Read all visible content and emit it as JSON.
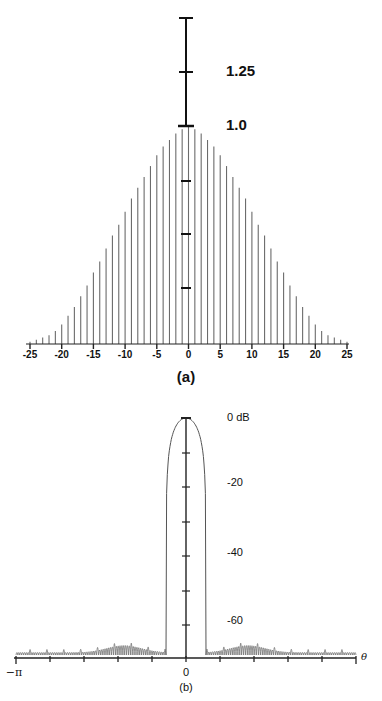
{
  "chart_data": [
    {
      "type": "bar",
      "title": "(a)",
      "caption": "(a)",
      "description": "Window sequence w[n] (stem plot), 51 samples",
      "xlabel": "",
      "ylabel": "",
      "x_ticks": [
        "-25",
        "-20",
        "-15",
        "-10",
        "-5",
        "0",
        "5",
        "10",
        "15",
        "20",
        "25"
      ],
      "y_scale_labels": [
        "1.25",
        "1.0"
      ],
      "ylim": [
        0,
        1.25
      ],
      "x": [
        -25,
        -24,
        -23,
        -22,
        -21,
        -20,
        -19,
        -18,
        -17,
        -16,
        -15,
        -14,
        -13,
        -12,
        -11,
        -10,
        -9,
        -8,
        -7,
        -6,
        -5,
        -4,
        -3,
        -2,
        -1,
        0,
        1,
        2,
        3,
        4,
        5,
        6,
        7,
        8,
        9,
        10,
        11,
        12,
        13,
        14,
        15,
        16,
        17,
        18,
        19,
        20,
        21,
        22,
        23,
        24,
        25
      ],
      "values": [
        0.01,
        0.02,
        0.03,
        0.04,
        0.06,
        0.09,
        0.13,
        0.17,
        0.22,
        0.27,
        0.33,
        0.38,
        0.44,
        0.5,
        0.55,
        0.61,
        0.67,
        0.72,
        0.77,
        0.82,
        0.87,
        0.91,
        0.94,
        0.97,
        0.99,
        1.0,
        0.99,
        0.97,
        0.94,
        0.91,
        0.87,
        0.82,
        0.77,
        0.72,
        0.67,
        0.61,
        0.55,
        0.5,
        0.44,
        0.38,
        0.33,
        0.27,
        0.22,
        0.17,
        0.13,
        0.09,
        0.06,
        0.04,
        0.03,
        0.02,
        0.01
      ],
      "grid": false
    },
    {
      "type": "line",
      "title": "(b)",
      "caption": "(b)",
      "description": "Log magnitude of the window's Fourier transform",
      "xlabel": "θ",
      "ylabel": "dB",
      "x_ticks": [
        "-π",
        "0",
        "π"
      ],
      "y_ticks": [
        "0 dB",
        "-20",
        "-40",
        "-60"
      ],
      "xlim": [
        -3.1416,
        3.1416
      ],
      "ylim": [
        -75,
        0
      ],
      "main_lobe_halfwidth_rad": 0.37,
      "sidelobe_peak_db": -71,
      "grid": false
    }
  ],
  "labels": {
    "a": {
      "scale_125": "1.25",
      "scale_10": "1.0",
      "caption": "(a)",
      "ticks": [
        "-25",
        "-20",
        "-15",
        "-10",
        "-5",
        "0",
        "5",
        "10",
        "15",
        "20",
        "25"
      ]
    },
    "b": {
      "db0": "0 dB",
      "db20": "-20",
      "db40": "-40",
      "db60": "-60",
      "neg_pi": "−π",
      "zero": "0",
      "pos_pi": "π",
      "theta": "θ",
      "caption": "(b)"
    }
  }
}
